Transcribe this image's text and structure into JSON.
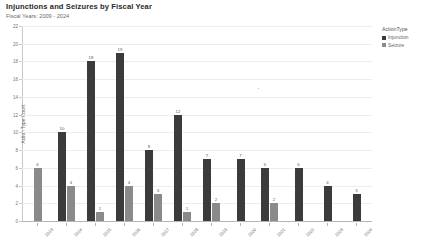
{
  "header": {
    "title": "Injunctions and Seizures by Fiscal Year",
    "subtitle": "Fiscal Years: 2009 - 2024"
  },
  "legend": {
    "title": "ActionType",
    "items": [
      {
        "label": "Injunction",
        "color": "#3b3b3b",
        "swatch_name": "legend-swatch-injunction"
      },
      {
        "label": "Seizure",
        "color": "#8a8a8a",
        "swatch_name": "legend-swatch-seizure"
      }
    ]
  },
  "chart_data": {
    "type": "bar",
    "title": "Injunctions and Seizures by Fiscal Year",
    "subtitle": "Fiscal Years: 2009 - 2024",
    "xlabel": "",
    "ylabel": "Action Type Count",
    "ylim": [
      0,
      22
    ],
    "yticks": [
      0,
      2,
      4,
      6,
      8,
      10,
      12,
      14,
      16,
      18,
      20,
      22
    ],
    "grid": true,
    "legend_position": "right",
    "categories": [
      "2013",
      "2014",
      "2015",
      "2016",
      "2017",
      "2018",
      "2019",
      "2020",
      "2021",
      "2022",
      "2023",
      "2024"
    ],
    "series": [
      {
        "name": "Injunction",
        "color": "#3b3b3b",
        "values": [
          null,
          10,
          18,
          19,
          8,
          12,
          7,
          7,
          6,
          6,
          4,
          3
        ]
      },
      {
        "name": "Seizure",
        "color": "#8a8a8a",
        "values": [
          6,
          4,
          1,
          4,
          3,
          1,
          2,
          null,
          2,
          null,
          null,
          null
        ]
      }
    ]
  }
}
